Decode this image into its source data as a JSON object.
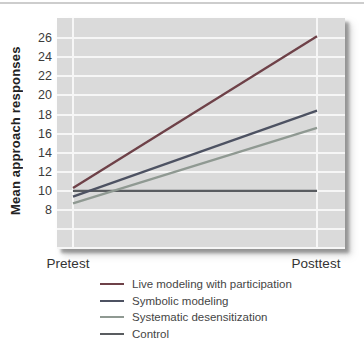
{
  "page": {
    "top_rule_color": "#cdcdcd",
    "plot_bg": "#dadada",
    "grid_color": "#f6f6f6",
    "shadow_color": "#6a6a6a"
  },
  "chart_data": {
    "type": "line",
    "title": "",
    "xlabel": "",
    "ylabel": "Mean approach responses",
    "x": [
      "Pretest",
      "Posttest"
    ],
    "series": [
      {
        "name": "Live modeling with participation",
        "values": [
          10.3,
          26.2
        ],
        "color": "#6e4148"
      },
      {
        "name": "Symbolic modeling",
        "values": [
          9.4,
          18.4
        ],
        "color": "#4d5262"
      },
      {
        "name": "Systematic desensitization",
        "values": [
          8.7,
          16.6
        ],
        "color": "#8f9992"
      },
      {
        "name": "Control",
        "values": [
          10,
          10
        ],
        "color": "#595c60"
      }
    ],
    "yticks": [
      26,
      24,
      22,
      20,
      18,
      16,
      14,
      12,
      10,
      8
    ],
    "grid_values": [
      26,
      24,
      22,
      20,
      18,
      16,
      14,
      12,
      10,
      8,
      6,
      4
    ],
    "ylim": [
      3.9,
      28.1
    ],
    "grid": true,
    "legend_position": "bottom-left"
  }
}
